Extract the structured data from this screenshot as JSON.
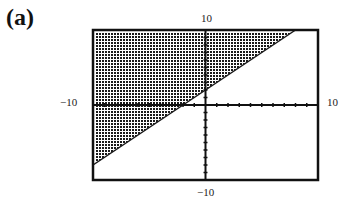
{
  "panel": {
    "label": "(a)"
  },
  "chart_data": {
    "type": "area",
    "title": "",
    "xlabel": "",
    "ylabel": "",
    "xlim": [
      -10,
      10
    ],
    "ylim": [
      -10,
      10
    ],
    "grid": false,
    "axis_tick_spacing": 1,
    "tick_labels": {
      "x_min": "-10",
      "x_max": "10",
      "y_min": "-10",
      "y_max": "10"
    },
    "boundary_line": {
      "slope": 1,
      "intercept": 2,
      "style": "solid"
    },
    "shaded_region": "y >= x + 2",
    "shading_pattern": "dot-checker",
    "colors": {
      "shade": "#1a1a1a",
      "frame": "#111111",
      "axis": "#111111",
      "background": "#ffffff"
    }
  },
  "labels": {
    "y_top": "10",
    "y_bottom": "−10",
    "x_left": "−10",
    "x_right": "10"
  }
}
